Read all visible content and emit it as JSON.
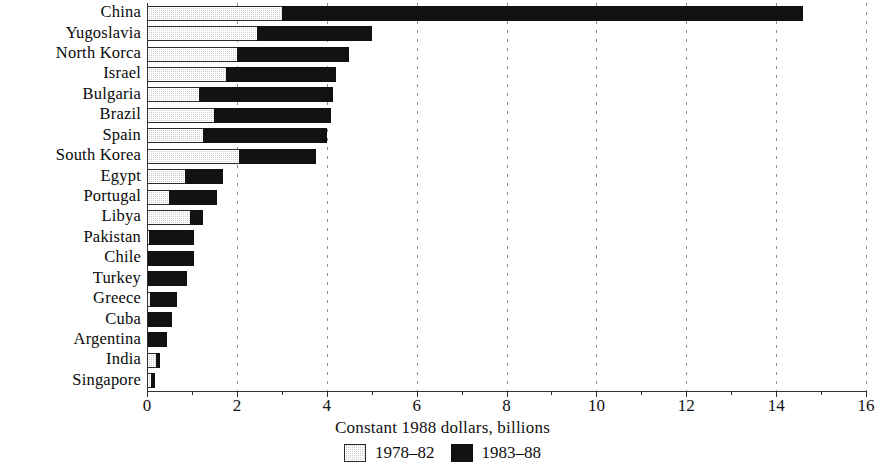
{
  "chart_data": {
    "type": "bar",
    "orientation": "horizontal",
    "stacked": true,
    "title": "",
    "xlabel": "Constant 1988 dollars, billions",
    "ylabel": "",
    "xlim": [
      0,
      16
    ],
    "xticks": [
      0,
      2,
      4,
      6,
      8,
      10,
      12,
      14,
      16
    ],
    "xtick_labels": [
      "0",
      "2",
      "4",
      "6",
      "8",
      "10",
      "12",
      "14",
      "16"
    ],
    "minor_tick_step": 1,
    "grid": "vertical dashed gridlines at major ticks",
    "legend_position": "bottom-center",
    "categories": [
      "China",
      "Yugoslavia",
      "North Korca",
      "Israel",
      "Bulgaria",
      "Brazil",
      "Spain",
      "South Korea",
      "Egypt",
      "Portugal",
      "Libya",
      "Pakistan",
      "Chile",
      "Turkey",
      "Greece",
      "Cuba",
      "Argentina",
      "India",
      "Singapore"
    ],
    "series": [
      {
        "name": "1978–82",
        "color": "#cfcfcf",
        "values": [
          3.0,
          2.45,
          2.0,
          1.75,
          1.15,
          1.5,
          1.25,
          2.05,
          0.85,
          0.5,
          0.95,
          0.05,
          0.0,
          0.0,
          0.07,
          0.0,
          0.0,
          0.2,
          0.1
        ]
      },
      {
        "name": "1983–88",
        "color": "#121212",
        "values": [
          11.6,
          2.55,
          2.5,
          2.45,
          3.0,
          2.6,
          2.75,
          1.7,
          0.85,
          1.05,
          0.3,
          1.0,
          1.05,
          0.9,
          0.6,
          0.55,
          0.45,
          0.1,
          0.08
        ]
      }
    ],
    "totals": [
      14.6,
      5.0,
      4.5,
      4.2,
      4.15,
      4.1,
      4.0,
      3.75,
      1.7,
      1.55,
      1.25,
      1.05,
      1.05,
      0.9,
      0.67,
      0.55,
      0.45,
      0.3,
      0.18
    ]
  },
  "legend": {
    "items": [
      {
        "label": "1978–82",
        "swatch": "stippled-gray"
      },
      {
        "label": "1983–88",
        "swatch": "solid-black"
      }
    ]
  }
}
